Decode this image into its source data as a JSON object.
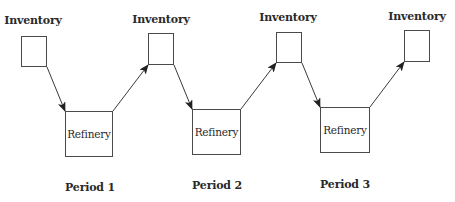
{
  "diagram": {
    "inventories": [
      {
        "label": "Inventory",
        "x": 21,
        "y": 36,
        "w": 26,
        "h": 31,
        "label_x": 33,
        "label_y": 20
      },
      {
        "label": "Inventory",
        "x": 148,
        "y": 33,
        "w": 26,
        "h": 32,
        "label_x": 161,
        "label_y": 19
      },
      {
        "label": "Inventory",
        "x": 276,
        "y": 32,
        "w": 26,
        "h": 31,
        "label_x": 288,
        "label_y": 17
      },
      {
        "label": "Inventory",
        "x": 404,
        "y": 30,
        "w": 26,
        "h": 32,
        "label_x": 417,
        "label_y": 16
      }
    ],
    "refineries": [
      {
        "label": "Refinery",
        "x": 65,
        "y": 111,
        "w": 48,
        "h": 46
      },
      {
        "label": "Refinery",
        "x": 192,
        "y": 109,
        "w": 49,
        "h": 46
      },
      {
        "label": "Refinery",
        "x": 320,
        "y": 107,
        "w": 50,
        "h": 46
      }
    ],
    "periods": [
      {
        "label": "Period 1",
        "x": 90,
        "y": 187
      },
      {
        "label": "Period 2",
        "x": 217,
        "y": 185
      },
      {
        "label": "Period 3",
        "x": 345,
        "y": 184
      }
    ],
    "arrows": [
      {
        "from": "inventory-1",
        "to": "refinery-1",
        "x1": 47,
        "y1": 67,
        "x2": 65,
        "y2": 111
      },
      {
        "from": "refinery-1",
        "to": "inventory-2",
        "x1": 113,
        "y1": 111,
        "x2": 148,
        "y2": 65
      },
      {
        "from": "inventory-2",
        "to": "refinery-2",
        "x1": 174,
        "y1": 65,
        "x2": 192,
        "y2": 109
      },
      {
        "from": "refinery-2",
        "to": "inventory-3",
        "x1": 241,
        "y1": 109,
        "x2": 276,
        "y2": 63
      },
      {
        "from": "inventory-3",
        "to": "refinery-3",
        "x1": 302,
        "y1": 63,
        "x2": 320,
        "y2": 107
      },
      {
        "from": "refinery-3",
        "to": "inventory-4",
        "x1": 370,
        "y1": 107,
        "x2": 404,
        "y2": 62
      }
    ],
    "colors": {
      "stroke": "#3a3a3a",
      "text": "#2a2a2a",
      "background": "#ffffff"
    }
  }
}
